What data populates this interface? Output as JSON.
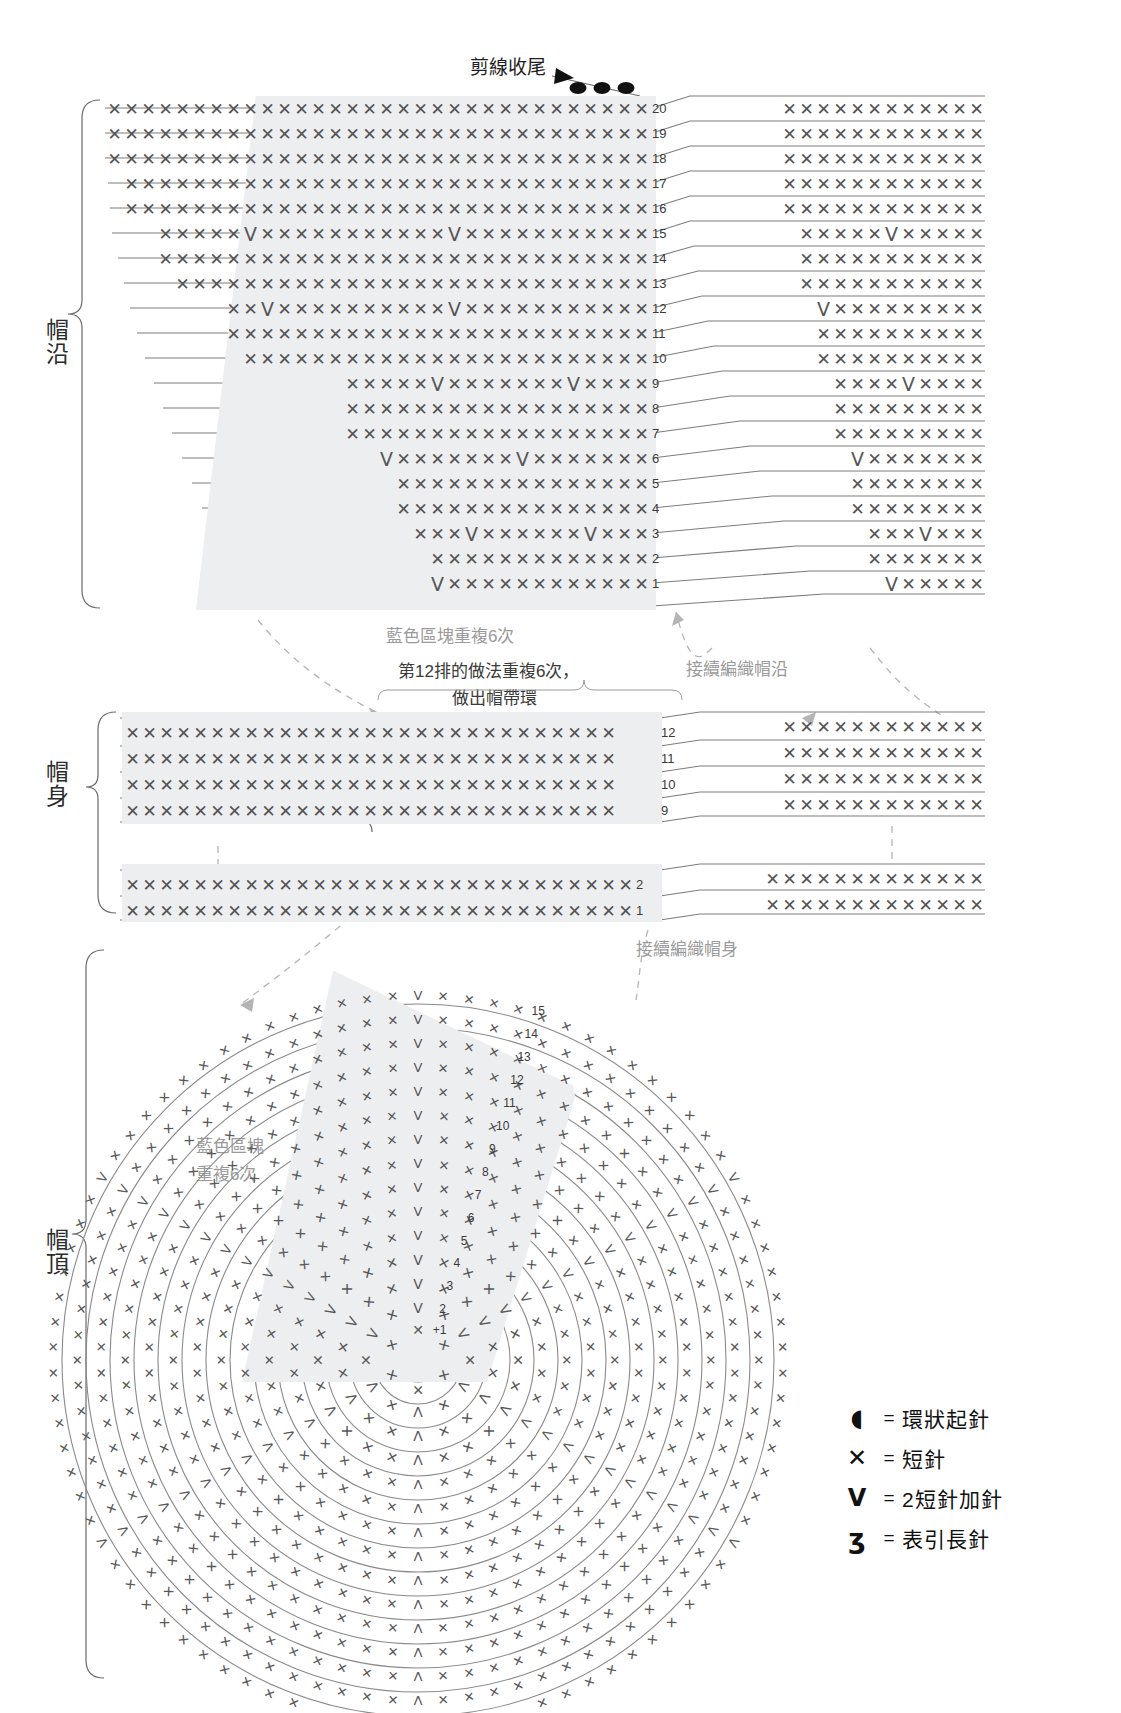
{
  "document": {
    "kind": "crochet-pattern-chart",
    "language": "zh-Hant"
  },
  "sections": {
    "brim": {
      "label": "帽沿"
    },
    "body": {
      "label": "帽身"
    },
    "crown": {
      "label": "帽頂"
    }
  },
  "annotations": {
    "finish_off": "剪線收尾",
    "blue_repeat_brim": "藍色區塊重複6次",
    "row12_note_line1": "第12排的做法重複6次，",
    "row12_note_line2": "做出帽帶環",
    "continue_brim": "接續編織帽沿",
    "continue_body": "接續編織帽身",
    "blue_repeat_crown_line1": "藍色區塊",
    "blue_repeat_crown_line2": "重複6次"
  },
  "legend": {
    "items": [
      {
        "symbol": "magic-ring",
        "glyph": "◉",
        "equals": "=",
        "label": "環狀起針"
      },
      {
        "symbol": "single-crochet",
        "glyph": "✕",
        "equals": "=",
        "label": "短針"
      },
      {
        "symbol": "sc-increase",
        "glyph": "V",
        "equals": "=",
        "label": "2短針加針"
      },
      {
        "symbol": "front-post-dc",
        "glyph": "ʓ",
        "equals": "=",
        "label": "表引長針"
      }
    ]
  },
  "brim_chart": {
    "type": "table",
    "title": "帽沿",
    "row_numbers": [
      20,
      19,
      18,
      17,
      16,
      15,
      14,
      13,
      12,
      11,
      10,
      9,
      8,
      7,
      6,
      5,
      4,
      3,
      2,
      1
    ],
    "stitch_symbols": {
      "sc": "✕",
      "inc": "V"
    },
    "left_panel_rows": [
      {
        "n": 20,
        "pattern": "XXXXXXXXXXXXXXXXXXXXXXXXXXXXXXXX"
      },
      {
        "n": 19,
        "pattern": "XXXXXXXXXXXXXXXXXXXXXXXXXXXXXXXX"
      },
      {
        "n": 18,
        "pattern": "XXXXXXXXXXXXXXXXXXXXXXXXXXXXXXXX"
      },
      {
        "n": 17,
        "pattern": "XXXXXXXXXXXXXXXXXXXXXXXXXXXXXXX"
      },
      {
        "n": 16,
        "pattern": "XXXXXXXXXXXXXXXXXXXXXXXXXXXXXXX"
      },
      {
        "n": 15,
        "pattern": "XXXXXVXXXXXXXXXXXVXXXXXXXXXXX"
      },
      {
        "n": 14,
        "pattern": "XXXXXXXXXXXXXXXXXXXXXXXXXXXXX"
      },
      {
        "n": 13,
        "pattern": "XXXXXXXXXXXXXXXXXXXXXXXXXXXX"
      },
      {
        "n": 12,
        "pattern": "XXVXXXXXXXXXXVXXXXXXXXXXX"
      },
      {
        "n": 11,
        "pattern": "XXXXXXXXXXXXXXXXXXXXXXXXX"
      },
      {
        "n": 10,
        "pattern": "XXXXXXXXXXXXXXXXXXXXXXXX"
      },
      {
        "n": 9,
        "pattern": "XXXXXVXXXXXXXVXXXX"
      },
      {
        "n": 8,
        "pattern": "XXXXXXXXXXXXXXXXXX"
      },
      {
        "n": 7,
        "pattern": "XXXXXXXXXXXXXXXXXX"
      },
      {
        "n": 6,
        "pattern": "VXXXXXXXVXXXXXXX"
      },
      {
        "n": 5,
        "pattern": "XXXXXXXXXXXXXXX"
      },
      {
        "n": 4,
        "pattern": "XXXXXXXXXXXXXXX"
      },
      {
        "n": 3,
        "pattern": "XXXVXXXXXXVXXX"
      },
      {
        "n": 2,
        "pattern": "XXXXXXXXXXXXX"
      },
      {
        "n": 1,
        "pattern": "VXXXXXXXXXXXX"
      }
    ],
    "right_panel_rows": [
      {
        "n": 20,
        "pattern": "XXXXXXXXXXXX"
      },
      {
        "n": 19,
        "pattern": "XXXXXXXXXXXX"
      },
      {
        "n": 18,
        "pattern": "XXXXXXXXXXXX"
      },
      {
        "n": 17,
        "pattern": "XXXXXXXXXXXX"
      },
      {
        "n": 16,
        "pattern": "XXXXXXXXXXXX"
      },
      {
        "n": 15,
        "pattern": "XXXXXVXXXXX"
      },
      {
        "n": 14,
        "pattern": "XXXXXXXXXXX"
      },
      {
        "n": 13,
        "pattern": "XXXXXXXXXXX"
      },
      {
        "n": 12,
        "pattern": "VXXXXXXXXX"
      },
      {
        "n": 11,
        "pattern": "XXXXXXXXXX"
      },
      {
        "n": 10,
        "pattern": "XXXXXXXXXX"
      },
      {
        "n": 9,
        "pattern": "XXXXVXXXX"
      },
      {
        "n": 8,
        "pattern": "XXXXXXXXX"
      },
      {
        "n": 7,
        "pattern": "XXXXXXXXX"
      },
      {
        "n": 6,
        "pattern": "VXXXXXXX"
      },
      {
        "n": 5,
        "pattern": "XXXXXXXX"
      },
      {
        "n": 4,
        "pattern": "XXXXXXXX"
      },
      {
        "n": 3,
        "pattern": "XXXVXXX"
      },
      {
        "n": 2,
        "pattern": "XXXXXXX"
      },
      {
        "n": 1,
        "pattern": "VXXXXX"
      }
    ]
  },
  "body_chart": {
    "type": "table",
    "title": "帽身",
    "row_numbers": [
      12,
      11,
      10,
      9,
      2,
      1
    ],
    "left_panel_rows": [
      {
        "n": 12,
        "pattern": "XXXXXXXXXXXXXX",
        "post": "XXXXXXXXXXXXXXX"
      },
      {
        "n": 11,
        "pattern": "XXXXXXXXXXXXXXXXXXXXXXXXXXXXX"
      },
      {
        "n": 10,
        "pattern": "XXXXXXXXXXXXXXXXXXXXXXXXXXXXX"
      },
      {
        "n": 9,
        "pattern": "XXXXXXXXXXXXXXXXXXXXXXXXXXXXX"
      },
      {
        "n": 2,
        "pattern": "XXXXXXXXXXXXXXXXXXXXXXXXXXXXXX"
      },
      {
        "n": 1,
        "pattern": "XXXXXXXXXXXXXXXXXXXXXXXXXXXXXX"
      }
    ],
    "right_panel_rows": [
      {
        "n": 12,
        "pattern": "XXXXXXXXXXXX"
      },
      {
        "n": 11,
        "pattern": "XXXXXXXXXXXX"
      },
      {
        "n": 10,
        "pattern": "XXXXXXXXXXXX"
      },
      {
        "n": 9,
        "pattern": "XXXXXXXXXXXX"
      },
      {
        "n": 2,
        "pattern": "XXXXXXXXXXXXX"
      },
      {
        "n": 1,
        "pattern": "XXXXXXXXXXXXX"
      }
    ]
  },
  "crown_chart": {
    "type": "spiral",
    "title": "帽頂",
    "start": "環狀起針",
    "round_numbers": [
      1,
      2,
      3,
      4,
      5,
      6,
      7,
      8,
      9,
      10,
      11,
      12,
      13,
      14,
      15
    ],
    "round_labels": [
      "+1",
      "2",
      "3",
      "4",
      "5",
      "6",
      "7",
      "8",
      "9",
      "10",
      "11",
      "12",
      "13",
      "14",
      "15"
    ],
    "note": "藍色區塊重複6次"
  }
}
